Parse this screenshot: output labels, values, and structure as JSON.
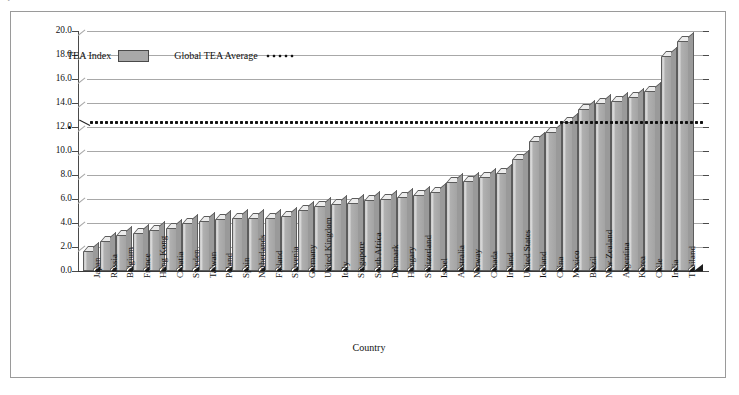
{
  "chart_data": {
    "type": "bar",
    "title": "",
    "xlabel": "Country",
    "ylabel": "Total Entrepreneurial Activity (TEA) Index",
    "ylim": [
      0.0,
      20.0
    ],
    "ytick_step": 2.0,
    "grid": true,
    "legend_position": "top-left-inside",
    "categories": [
      "Japan",
      "Russia",
      "Belgium",
      "France",
      "Hong Kong",
      "Croatia",
      "Sweden",
      "Taiwan",
      "Poland",
      "Spain",
      "Netherlands",
      "Finland",
      "Slovenia",
      "Germany",
      "United Kingdom",
      "Italy",
      "Singapore",
      "South Africa",
      "Denmark",
      "Hungary",
      "Switzerland",
      "Israel",
      "Australia",
      "Norway",
      "Canada",
      "Ireland",
      "United States",
      "Iceland",
      "China",
      "Mexico",
      "Brazil",
      "New Zealand",
      "Argentina",
      "Korea",
      "Chile",
      "India",
      "Thailand"
    ],
    "series": [
      {
        "name": "TEA Index",
        "color": "#a8a8a8",
        "values": [
          1.7,
          2.5,
          3.0,
          3.2,
          3.4,
          3.6,
          4.0,
          4.2,
          4.3,
          4.4,
          4.4,
          4.4,
          4.6,
          5.1,
          5.4,
          5.6,
          5.7,
          5.9,
          6.0,
          6.2,
          6.3,
          6.6,
          7.4,
          7.5,
          7.8,
          8.2,
          9.3,
          10.8,
          11.6,
          12.4,
          13.5,
          14.0,
          14.2,
          14.5,
          15.0,
          17.9,
          19.2
        ]
      }
    ],
    "reference_line": {
      "name": "Global TEA Average",
      "value": 12.4,
      "style": "dotted",
      "color": "#111111"
    }
  },
  "legend": {
    "bar_label": "TEA Index",
    "line_label": "Global TEA Average"
  },
  "axes": {
    "y_ticks": [
      "0.0",
      "2.0",
      "4.0",
      "6.0",
      "8.0",
      "10.0",
      "12.0",
      "14.0",
      "16.0",
      "18.0",
      "20.0"
    ],
    "y_title": "Total Entrepreneurial Activity (TEA) Index",
    "x_title": "Country"
  }
}
